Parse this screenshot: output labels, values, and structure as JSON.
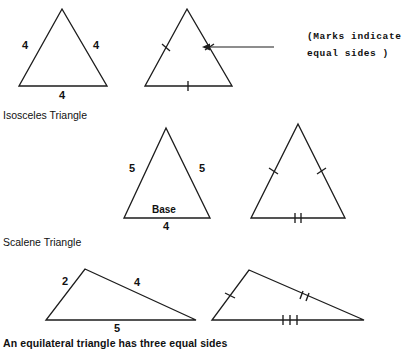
{
  "figure": {
    "stroke_color": "#1d1d1d",
    "background": "#ffffff",
    "annotation": {
      "line1": "(Marks  indicate",
      "line2": "equal  sides )",
      "arrow_name": "annotation-arrow"
    },
    "footer_text": "An equilateral triangle has three equal sides"
  },
  "sections": [
    {
      "label": "Isosceles Triangle",
      "triangles": [
        {
          "name": "equilateral-labeled",
          "side_labels": [
            "4",
            "4",
            "4"
          ]
        },
        {
          "name": "equilateral-ticked",
          "tick_counts": [
            1,
            1,
            1
          ]
        }
      ]
    },
    {
      "label": "Scalene Triangle",
      "triangles": [
        {
          "name": "isosceles-labeled",
          "side_labels": [
            "5",
            "5",
            "4"
          ],
          "base_word": "Base"
        },
        {
          "name": "isosceles-ticked",
          "tick_counts": [
            1,
            1,
            2
          ]
        }
      ]
    },
    {
      "label": "",
      "triangles": [
        {
          "name": "scalene-labeled",
          "side_labels": [
            "2",
            "4",
            "5"
          ]
        },
        {
          "name": "scalene-ticked",
          "tick_counts": [
            1,
            2,
            3
          ]
        }
      ]
    }
  ],
  "labels": {
    "t1_left": "4",
    "t1_right": "4",
    "t1_base": "4",
    "t3_left": "5",
    "t3_right": "5",
    "t3_base": "4",
    "t3_base_word": "Base",
    "t5_left": "2",
    "t5_right": "4",
    "t5_base": "5",
    "section1": "Isosceles Triangle",
    "section2": "Scalene Triangle",
    "footer": "An equilateral triangle has three equal sides",
    "note1": "(Marks  indicate",
    "note2": "equal  sides )"
  }
}
